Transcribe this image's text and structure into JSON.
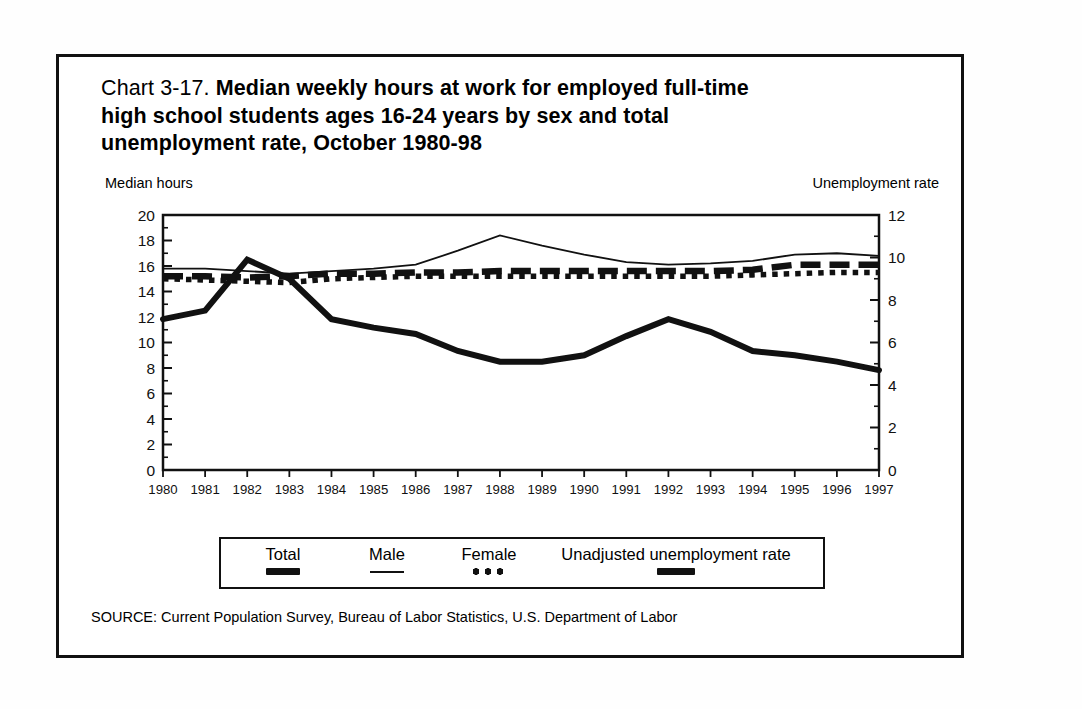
{
  "title": {
    "chart_number": "Chart 3-17.",
    "line1": "Median weekly hours at work for employed full-time",
    "line2": "high school students ages 16-24 years by sex and total",
    "line3": "unemployment rate, October 1980-98"
  },
  "axis_captions": {
    "left": "Median hours",
    "right": "Unemployment rate"
  },
  "legend": {
    "items": [
      {
        "label": "Total",
        "style": "thick-dashed"
      },
      {
        "label": "Male",
        "style": "thin-solid"
      },
      {
        "label": "Female",
        "style": "dotted"
      },
      {
        "label": "Unadjusted unemployment rate",
        "style": "thick-solid"
      }
    ]
  },
  "source": "SOURCE: Current Population Survey, Bureau of Labor Statistics, U.S. Department of Labor",
  "chart_data": {
    "type": "line",
    "title": "Chart 3-17. Median weekly hours at work for employed full-time high school students ages 16-24 years by sex and total unemployment rate, October 1980-98",
    "xlabel": "",
    "ylabel": "Median hours",
    "y2label": "Unemployment rate",
    "grid": false,
    "legend_position": "bottom",
    "x": [
      1980,
      1981,
      1982,
      1983,
      1984,
      1985,
      1986,
      1987,
      1988,
      1989,
      1990,
      1991,
      1992,
      1993,
      1994,
      1995,
      1996,
      1997
    ],
    "xtick_labels": [
      "1980",
      "1981",
      "1982",
      "1983",
      "1984",
      "1985",
      "1986",
      "1987",
      "1988",
      "1989",
      "1990",
      "1991",
      "1992",
      "1993",
      "1994",
      "1995",
      "1996",
      "1997"
    ],
    "ylim": [
      0,
      20
    ],
    "yticks": [
      0,
      2,
      4,
      6,
      8,
      10,
      12,
      14,
      16,
      18,
      20
    ],
    "y2lim": [
      0,
      12
    ],
    "y2ticks": [
      0,
      2,
      4,
      6,
      8,
      10,
      12
    ],
    "series": [
      {
        "name": "Total",
        "axis": "left",
        "style": "thick-dashed",
        "values": [
          15.2,
          15.2,
          15.1,
          15.2,
          15.4,
          15.4,
          15.5,
          15.5,
          15.6,
          15.6,
          15.6,
          15.6,
          15.6,
          15.6,
          15.7,
          16.1,
          16.1,
          16.1
        ]
      },
      {
        "name": "Male",
        "axis": "left",
        "style": "thin-solid",
        "values": [
          15.8,
          15.8,
          15.6,
          15.4,
          15.6,
          15.8,
          16.1,
          17.2,
          18.4,
          17.6,
          16.9,
          16.3,
          16.1,
          16.2,
          16.4,
          16.9,
          17.0,
          16.8
        ]
      },
      {
        "name": "Female",
        "axis": "left",
        "style": "dotted",
        "values": [
          15.0,
          14.9,
          14.8,
          14.7,
          15.0,
          15.1,
          15.2,
          15.2,
          15.2,
          15.2,
          15.2,
          15.2,
          15.2,
          15.2,
          15.3,
          15.4,
          15.5,
          15.5
        ]
      },
      {
        "name": "Unadjusted unemployment rate",
        "axis": "right",
        "style": "thick-solid",
        "values": [
          7.1,
          7.5,
          9.9,
          9.0,
          7.1,
          6.7,
          6.4,
          5.6,
          5.1,
          5.1,
          5.4,
          6.3,
          7.1,
          6.5,
          5.6,
          5.4,
          5.1,
          4.7
        ]
      }
    ]
  }
}
